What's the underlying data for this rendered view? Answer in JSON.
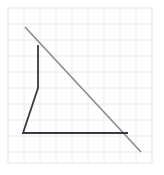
{
  "figure": {
    "canvas": {
      "width": 164,
      "height": 175,
      "background": "#ffffff"
    },
    "grid": {
      "visible": true,
      "x0": 8,
      "y0": 8,
      "x1": 152,
      "y1": 163,
      "cell_size": 16,
      "line_color": "#e9eaee",
      "border_color": "#e4e5ea",
      "columns": 9,
      "rows": 10
    },
    "shapes": [
      {
        "name": "diagonal-line",
        "type": "line",
        "stroke": "#8a8a8e",
        "stroke_width": 1.6,
        "points": [
          [
            25,
            27
          ],
          [
            141,
            152
          ]
        ],
        "label": "hypotenuse"
      },
      {
        "name": "dark-polyline",
        "type": "polyline",
        "stroke": "#3a3a42",
        "stroke_width": 1.8,
        "closed": false,
        "points": [
          [
            38,
            45
          ],
          [
            38,
            88
          ],
          [
            23,
            133
          ],
          [
            128,
            133
          ]
        ],
        "label": "bent figure outline"
      }
    ],
    "vertices": [
      {
        "name": "diagonal-start",
        "x": 25,
        "y": 27
      },
      {
        "name": "vertical-top",
        "x": 38,
        "y": 45
      },
      {
        "name": "bend-point",
        "x": 38,
        "y": 88
      },
      {
        "name": "bottom-left-corner",
        "x": 23,
        "y": 133
      },
      {
        "name": "bottom-right-intersection",
        "x": 128,
        "y": 133
      },
      {
        "name": "diagonal-end",
        "x": 141,
        "y": 152
      }
    ],
    "colors": {
      "dark_stroke": "#3a3a42",
      "light_stroke": "#8a8a8e",
      "grid": "#e9eaee",
      "background": "#ffffff"
    }
  },
  "chart_data": {
    "type": "line",
    "xlabel": "",
    "ylabel": "",
    "xlim": [
      8,
      152
    ],
    "ylim": [
      8,
      163
    ],
    "grid": true,
    "legend": "none",
    "series": [
      {
        "name": "diagonal-line",
        "color": "#8a8a8e",
        "x": [
          25,
          141
        ],
        "y": [
          27,
          152
        ]
      },
      {
        "name": "dark-polyline",
        "color": "#3a3a42",
        "x": [
          38,
          38,
          23,
          128
        ],
        "y": [
          45,
          88,
          133,
          133
        ]
      }
    ]
  }
}
